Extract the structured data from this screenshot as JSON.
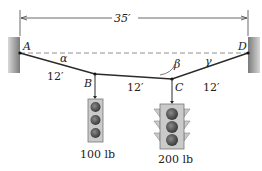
{
  "figure": {
    "span_label": "35′",
    "points": {
      "A": "A",
      "B": "B",
      "C": "C",
      "D": "D"
    },
    "angles": {
      "alpha": "α",
      "beta": "β",
      "gamma": "γ"
    },
    "segments": {
      "AB": "12′",
      "BC": "12′",
      "CD": "12′"
    },
    "loads": {
      "B": "100 lb",
      "C": "200 lb"
    }
  },
  "colors": {
    "line": "#2a2a2a",
    "wall": "#8e8e8e",
    "light_body": "#c9c9c9",
    "lamp": "#555555"
  }
}
